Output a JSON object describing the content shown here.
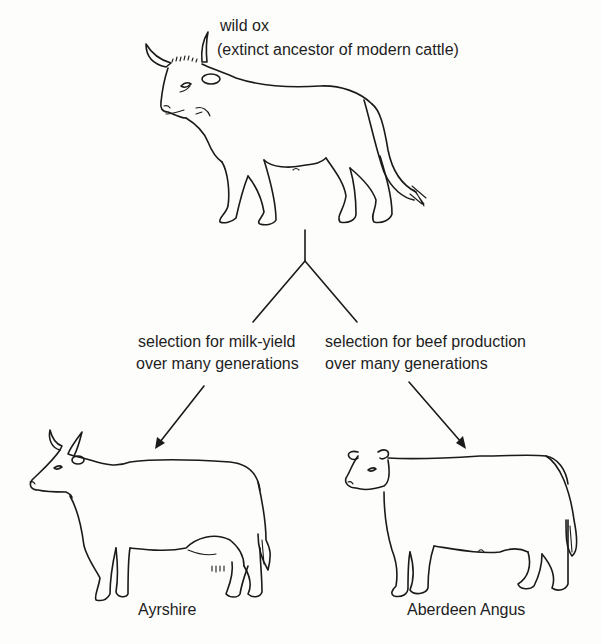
{
  "diagram": {
    "type": "selective-breeding-tree",
    "ancestor": {
      "name": "wild ox",
      "description": "(extinct ancestor of modern cattle)"
    },
    "branches": [
      {
        "selection_line1": "selection for milk-yield",
        "selection_line2": "over many generations",
        "result": "Ayrshire"
      },
      {
        "selection_line1": "selection for beef production",
        "selection_line2": "over many generations",
        "result": "Aberdeen Angus"
      }
    ],
    "colors": {
      "ink": "#1a1a1a",
      "background": "#fdfdfc"
    }
  }
}
